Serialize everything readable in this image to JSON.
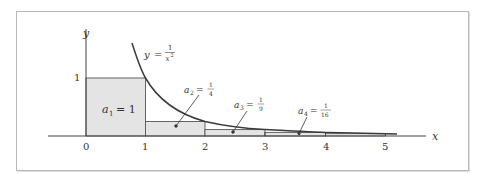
{
  "diagram": {
    "curve_label": {
      "lhs": "y",
      "eq": "=",
      "num": "1",
      "den": "x",
      "exp": "2"
    },
    "axes": {
      "x_label": "x",
      "y_label": "y",
      "y_tick": "1",
      "x_ticks": [
        "0",
        "1",
        "2",
        "3",
        "4",
        "5"
      ]
    },
    "rectangles": [
      {
        "name": "a",
        "sub": "1",
        "eq": "= 1",
        "height": 1
      },
      {
        "name": "a",
        "sub": "2",
        "num": "1",
        "den": "4",
        "height": 0.25
      },
      {
        "name": "a",
        "sub": "3",
        "num": "1",
        "den": "9",
        "height": 0.1111
      },
      {
        "name": "a",
        "sub": "4",
        "num": "1",
        "den": "16",
        "height": 0.0625
      }
    ],
    "colors": {
      "fill": "#e4e4e4",
      "stroke": "#444444",
      "curve": "#3a3a3a"
    }
  }
}
